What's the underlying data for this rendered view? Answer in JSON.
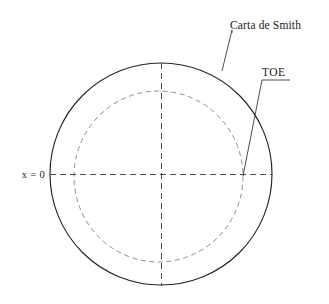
{
  "figure": {
    "title_label": "Carta de Smith",
    "secondary_label": "TOE",
    "axis_label": "x = 0",
    "colors": {
      "outer_circle_stroke": "#242424",
      "inner_circle_stroke": "#8d8d8d",
      "axis_stroke": "#4a4a4a",
      "leader_stroke": "#3a3a3a",
      "background": "#ffffff",
      "text": "#1a1a1a"
    },
    "geometry": {
      "outer_circle": {
        "cx": 161,
        "cy": 174,
        "r": 111
      },
      "inner_circle": {
        "cx": 158.5,
        "cy": 176.5,
        "rx": 84.5,
        "ry": 85.5
      },
      "horizontal_axis": {
        "x1": 50,
        "y1": 174.5,
        "x2": 272,
        "y2": 174.5
      },
      "vertical_axis": {
        "x1": 161.5,
        "y1": 63,
        "x2": 161.5,
        "y2": 286
      }
    },
    "leaders": [
      {
        "name": "carta-de-smith-leader",
        "points": "232,33 232,30 222,71"
      },
      {
        "name": "toe-leader",
        "points": "290,80 262,80 243,176"
      }
    ]
  }
}
